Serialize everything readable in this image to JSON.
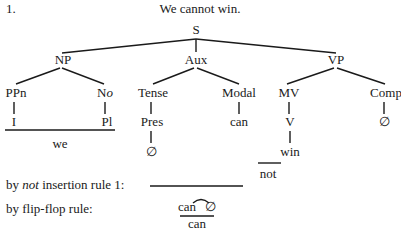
{
  "example_number": "1.",
  "sentence": "We cannot win.",
  "tree": {
    "root": "S",
    "np": {
      "label": "NP",
      "children": [
        {
          "label": "PPn",
          "leaf": "I"
        },
        {
          "label_main": "N",
          "label_italic": "o",
          "leaf": "Pl"
        }
      ],
      "realization": "we"
    },
    "aux": {
      "label": "Aux",
      "tense": {
        "label": "Tense",
        "child": "Pres",
        "leaf": "∅"
      },
      "modal": {
        "label": "Modal",
        "leaf": "can"
      }
    },
    "vp": {
      "label": "VP",
      "mv": {
        "label": "MV",
        "child": "V",
        "leaf": "win"
      },
      "comp": {
        "label": "Comp",
        "leaf": "∅"
      }
    }
  },
  "inserted_word": "not",
  "rules": {
    "not_insertion": {
      "prefix": "by ",
      "italic": "not",
      "suffix": " insertion rule 1:"
    },
    "flip_flop": {
      "label": "by flip-flop rule:",
      "pair_left": "can",
      "pair_right": "∅",
      "result": "can"
    }
  }
}
